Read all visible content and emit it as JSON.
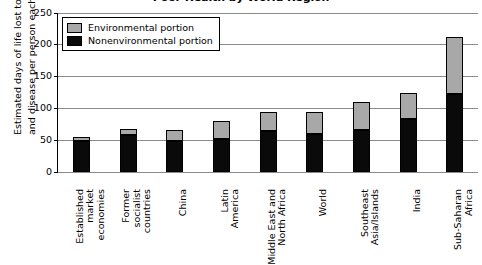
{
  "chart_data": {
    "type": "bar",
    "title": "Poor Health by World Region",
    "xlabel": "",
    "ylabel": "Estimated days of life lost to death and disease per person each year",
    "ylabel_line1": "Estimated days of life lost to death",
    "ylabel_line2": "and disease per person each year",
    "ylim": [
      0,
      250
    ],
    "yticks": [
      0,
      50,
      100,
      150,
      200,
      250
    ],
    "ytick_labels": [
      "0",
      "50",
      "100",
      "150",
      "200",
      "250"
    ],
    "grid": true,
    "stacked": true,
    "legend_position": "upper left",
    "categories": [
      "Established market economies",
      "Former socialist countries",
      "China",
      "Latin America",
      "Middle East and North Africa",
      "World",
      "Southeast Asia/Islands",
      "India",
      "Sub-Saharan Africa"
    ],
    "category_lines": [
      [
        "Established",
        "market",
        "economies"
      ],
      [
        "Former",
        "socialist",
        "countries"
      ],
      [
        "China"
      ],
      [
        "Latin",
        "America"
      ],
      [
        "Middle East and",
        "North Africa"
      ],
      [
        "World"
      ],
      [
        "Southeast",
        "Asia/Islands"
      ],
      [
        "India"
      ],
      [
        "Sub-Saharan",
        "Africa"
      ]
    ],
    "series": [
      {
        "name": "Nonenvironmental portion",
        "color": "#0a0a0a",
        "values": [
          48,
          58,
          49,
          52,
          64,
          60,
          66,
          83,
          122
        ]
      },
      {
        "name": "Environmental portion",
        "color": "#a8a8a8",
        "values": [
          7,
          9,
          17,
          28,
          31,
          35,
          44,
          42,
          90
        ]
      }
    ],
    "totals": [
      55,
      67,
      66,
      80,
      95,
      95,
      110,
      125,
      212
    ]
  },
  "legend": {
    "items": [
      {
        "label": "Environmental portion",
        "color": "#a8a8a8"
      },
      {
        "label": "Nonenvironmental portion",
        "color": "#0a0a0a"
      }
    ]
  },
  "colors": {
    "environmental": "#a8a8a8",
    "nonenvironmental": "#0a0a0a",
    "gridline": "#8a8a8a",
    "axis": "#000000",
    "background": "#ffffff"
  }
}
